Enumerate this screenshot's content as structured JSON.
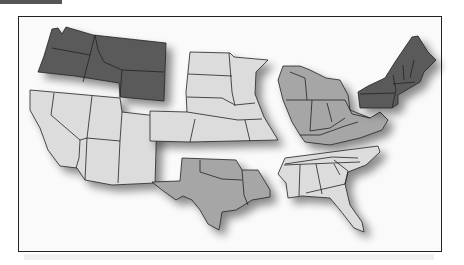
{
  "map": {
    "title": "",
    "colors": {
      "dark": "#5a5a5a",
      "medium": "#a6a6a6",
      "light": "#dcdcdc",
      "border": "#222222",
      "frame": "#222222"
    },
    "regions": [
      {
        "name": "Northwest",
        "shade": "dark"
      },
      {
        "name": "Southwest",
        "shade": "light"
      },
      {
        "name": "Plains",
        "shade": "light"
      },
      {
        "name": "Midwest",
        "shade": "medium"
      },
      {
        "name": "Northeast",
        "shade": "dark"
      },
      {
        "name": "South Central",
        "shade": "medium"
      },
      {
        "name": "Southeast",
        "shade": "light"
      }
    ]
  }
}
